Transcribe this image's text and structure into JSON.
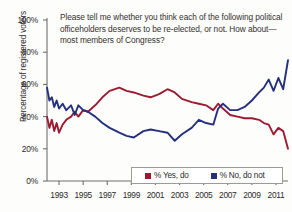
{
  "chart_data": {
    "type": "line",
    "title": "Please tell me whether you think each of the following political officeholders deserves to be re-elected, or not. How about—most members of Congress?",
    "xlabel": "",
    "ylabel": "Percentage of registered voters",
    "ylim": [
      0,
      100
    ],
    "xlim": [
      1992,
      2012
    ],
    "grid": false,
    "legend_position": "bottom-right",
    "ytick_labels": [
      "100%",
      "80%",
      "60%",
      "40%",
      "20%",
      "0%"
    ],
    "ytick_values": [
      100,
      80,
      60,
      40,
      20,
      0
    ],
    "xtick_labels": [
      "1993",
      "1995",
      "1997",
      "1999",
      "2001",
      "2003",
      "2005",
      "2007",
      "2009",
      "2011"
    ],
    "xtick_values": [
      1993,
      1995,
      1997,
      1999,
      2001,
      2003,
      2005,
      2007,
      2009,
      2011
    ],
    "series": [
      {
        "name": "% Yes, do",
        "color": "#9b1b30",
        "x": [
          1992.0,
          1992.2,
          1992.4,
          1992.6,
          1992.8,
          1993.0,
          1993.3,
          1993.6,
          1994.0,
          1994.3,
          1994.6,
          1995.0,
          1995.4,
          1996.0,
          1996.6,
          1997.2,
          1998.0,
          1998.6,
          1999.2,
          2000.0,
          2000.6,
          2001.3,
          2002.0,
          2002.6,
          2003.2,
          2004.0,
          2004.6,
          2005.2,
          2005.8,
          2006.2,
          2006.6,
          2007.2,
          2007.8,
          2008.4,
          2009.0,
          2009.6,
          2010.0,
          2010.4,
          2010.8,
          2011.2,
          2011.6,
          2012.0
        ],
        "y": [
          40,
          33,
          38,
          31,
          36,
          30,
          35,
          38,
          40,
          43,
          40,
          44,
          43,
          47,
          52,
          56,
          58,
          56,
          55,
          53,
          52,
          54,
          57,
          55,
          51,
          49,
          48,
          47,
          44,
          48,
          45,
          41,
          40,
          39,
          39,
          38,
          36,
          35,
          29,
          33,
          31,
          20
        ]
      },
      {
        "name": "% No, do not",
        "color": "#24307e",
        "x": [
          1992.0,
          1992.2,
          1992.4,
          1992.6,
          1992.8,
          1993.0,
          1993.3,
          1993.6,
          1994.0,
          1994.3,
          1994.6,
          1995.0,
          1995.4,
          1996.0,
          1996.6,
          1997.2,
          1998.0,
          1998.6,
          1999.2,
          2000.0,
          2000.6,
          2001.3,
          2002.0,
          2002.6,
          2003.2,
          2004.0,
          2004.6,
          2005.2,
          2005.8,
          2006.2,
          2006.6,
          2007.2,
          2007.8,
          2008.4,
          2009.0,
          2009.6,
          2010.0,
          2010.4,
          2010.8,
          2011.2,
          2011.6,
          2012.0
        ],
        "y": [
          58,
          50,
          52,
          46,
          50,
          45,
          48,
          44,
          47,
          41,
          47,
          44,
          43,
          40,
          36,
          33,
          30,
          28,
          27,
          31,
          32,
          31,
          30,
          25,
          29,
          33,
          38,
          36,
          35,
          45,
          48,
          44,
          44,
          46,
          50,
          55,
          58,
          63,
          56,
          64,
          57,
          75
        ]
      }
    ]
  },
  "legend": {
    "entries": [
      {
        "label": "% Yes, do",
        "color": "#9b1b30"
      },
      {
        "label": "% No, do not",
        "color": "#24307e"
      }
    ]
  }
}
